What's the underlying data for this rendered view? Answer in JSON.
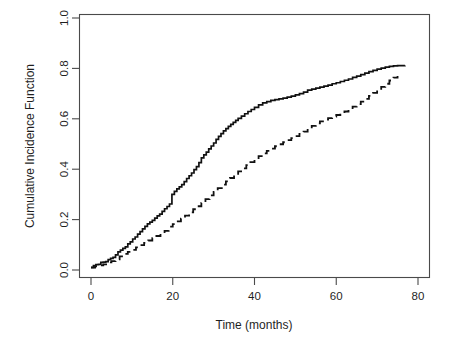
{
  "chart_data": {
    "type": "line",
    "title": "",
    "xlabel": "Time (months)",
    "ylabel": "Cumulative Incidence Function",
    "xlim": [
      -2.9,
      82.5
    ],
    "ylim": [
      -0.048,
      1.032
    ],
    "xticks": [
      0,
      20,
      40,
      60,
      80
    ],
    "xticklabels": [
      "0",
      "20",
      "40",
      "60",
      "80"
    ],
    "yticks": [
      0.0,
      0.2,
      0.4,
      0.6,
      0.8,
      1.0
    ],
    "yticklabels": [
      "0.0",
      "0.2",
      "0.4",
      "0.6",
      "0.8",
      "1.0"
    ],
    "grid": false,
    "legend": null,
    "box": true,
    "series": [
      {
        "name": "solid-curve",
        "style": "solid",
        "color": "#111111",
        "linewidth": 1.7,
        "points": [
          [
            0.0,
            0.01
          ],
          [
            0.6,
            0.017
          ],
          [
            1.2,
            0.021
          ],
          [
            1.8,
            0.022
          ],
          [
            2.4,
            0.03
          ],
          [
            3.0,
            0.031
          ],
          [
            3.6,
            0.033
          ],
          [
            4.2,
            0.041
          ],
          [
            4.8,
            0.046
          ],
          [
            5.4,
            0.05
          ],
          [
            6.0,
            0.06
          ],
          [
            6.6,
            0.072
          ],
          [
            7.2,
            0.079
          ],
          [
            7.8,
            0.086
          ],
          [
            8.4,
            0.092
          ],
          [
            9.0,
            0.104
          ],
          [
            9.6,
            0.112
          ],
          [
            10.2,
            0.123
          ],
          [
            10.8,
            0.131
          ],
          [
            11.4,
            0.142
          ],
          [
            12.0,
            0.152
          ],
          [
            12.6,
            0.163
          ],
          [
            13.2,
            0.173
          ],
          [
            13.8,
            0.183
          ],
          [
            14.4,
            0.19
          ],
          [
            15.0,
            0.197
          ],
          [
            15.6,
            0.206
          ],
          [
            16.2,
            0.215
          ],
          [
            16.8,
            0.222
          ],
          [
            17.4,
            0.233
          ],
          [
            18.0,
            0.243
          ],
          [
            18.6,
            0.252
          ],
          [
            19.2,
            0.262
          ],
          [
            19.8,
            0.3
          ],
          [
            20.4,
            0.312
          ],
          [
            21.0,
            0.322
          ],
          [
            21.6,
            0.33
          ],
          [
            22.2,
            0.339
          ],
          [
            22.8,
            0.351
          ],
          [
            23.4,
            0.363
          ],
          [
            24.0,
            0.374
          ],
          [
            24.6,
            0.385
          ],
          [
            25.2,
            0.398
          ],
          [
            25.8,
            0.41
          ],
          [
            26.4,
            0.426
          ],
          [
            27.0,
            0.445
          ],
          [
            27.6,
            0.457
          ],
          [
            28.2,
            0.468
          ],
          [
            28.8,
            0.481
          ],
          [
            29.4,
            0.492
          ],
          [
            30.0,
            0.504
          ],
          [
            30.6,
            0.518
          ],
          [
            31.2,
            0.53
          ],
          [
            31.8,
            0.541
          ],
          [
            32.4,
            0.552
          ],
          [
            33.0,
            0.561
          ],
          [
            33.6,
            0.57
          ],
          [
            34.2,
            0.578
          ],
          [
            34.8,
            0.586
          ],
          [
            35.4,
            0.594
          ],
          [
            36.0,
            0.602
          ],
          [
            36.8,
            0.611
          ],
          [
            37.6,
            0.62
          ],
          [
            38.4,
            0.629
          ],
          [
            39.2,
            0.637
          ],
          [
            40.0,
            0.645
          ],
          [
            41.0,
            0.655
          ],
          [
            42.0,
            0.663
          ],
          [
            43.0,
            0.668
          ],
          [
            44.0,
            0.673
          ],
          [
            45.0,
            0.676
          ],
          [
            46.0,
            0.679
          ],
          [
            47.0,
            0.682
          ],
          [
            48.0,
            0.686
          ],
          [
            49.0,
            0.69
          ],
          [
            50.0,
            0.695
          ],
          [
            51.0,
            0.7
          ],
          [
            52.0,
            0.706
          ],
          [
            53.0,
            0.714
          ],
          [
            54.0,
            0.718
          ],
          [
            55.0,
            0.722
          ],
          [
            56.0,
            0.726
          ],
          [
            57.0,
            0.73
          ],
          [
            58.0,
            0.734
          ],
          [
            59.0,
            0.739
          ],
          [
            60.0,
            0.743
          ],
          [
            61.0,
            0.748
          ],
          [
            62.0,
            0.753
          ],
          [
            63.0,
            0.758
          ],
          [
            64.0,
            0.764
          ],
          [
            65.0,
            0.769
          ],
          [
            66.0,
            0.775
          ],
          [
            67.0,
            0.781
          ],
          [
            68.0,
            0.787
          ],
          [
            69.0,
            0.792
          ],
          [
            70.0,
            0.797
          ],
          [
            71.0,
            0.801
          ],
          [
            72.0,
            0.805
          ],
          [
            73.0,
            0.808
          ],
          [
            74.0,
            0.81
          ],
          [
            75.0,
            0.811
          ],
          [
            76.8,
            0.812
          ]
        ]
      },
      {
        "name": "dashed-curve",
        "style": "dashed",
        "color": "#111111",
        "linewidth": 1.8,
        "dasharray": "7,5",
        "points": [
          [
            0.0,
            0.01
          ],
          [
            1.0,
            0.014
          ],
          [
            2.0,
            0.018
          ],
          [
            3.0,
            0.022
          ],
          [
            4.0,
            0.03
          ],
          [
            5.0,
            0.035
          ],
          [
            6.0,
            0.042
          ],
          [
            7.0,
            0.054
          ],
          [
            8.0,
            0.064
          ],
          [
            9.0,
            0.072
          ],
          [
            10.0,
            0.08
          ],
          [
            11.0,
            0.09
          ],
          [
            12.0,
            0.099
          ],
          [
            13.0,
            0.108
          ],
          [
            14.0,
            0.117
          ],
          [
            15.0,
            0.126
          ],
          [
            16.0,
            0.135
          ],
          [
            17.0,
            0.145
          ],
          [
            18.0,
            0.155
          ],
          [
            19.0,
            0.172
          ],
          [
            20.0,
            0.182
          ],
          [
            21.0,
            0.193
          ],
          [
            22.0,
            0.204
          ],
          [
            23.0,
            0.216
          ],
          [
            24.0,
            0.229
          ],
          [
            25.0,
            0.241
          ],
          [
            26.0,
            0.253
          ],
          [
            27.0,
            0.266
          ],
          [
            28.0,
            0.281
          ],
          [
            29.0,
            0.296
          ],
          [
            30.0,
            0.31
          ],
          [
            31.0,
            0.325
          ],
          [
            32.0,
            0.339
          ],
          [
            33.0,
            0.352
          ],
          [
            34.0,
            0.365
          ],
          [
            35.0,
            0.378
          ],
          [
            36.0,
            0.391
          ],
          [
            37.0,
            0.403
          ],
          [
            38.0,
            0.416
          ],
          [
            39.0,
            0.428
          ],
          [
            40.0,
            0.44
          ],
          [
            41.0,
            0.452
          ],
          [
            42.0,
            0.463
          ],
          [
            43.0,
            0.473
          ],
          [
            44.0,
            0.482
          ],
          [
            45.0,
            0.491
          ],
          [
            46.0,
            0.499
          ],
          [
            47.0,
            0.507
          ],
          [
            48.0,
            0.515
          ],
          [
            49.0,
            0.523
          ],
          [
            50.0,
            0.531
          ],
          [
            51.0,
            0.54
          ],
          [
            52.0,
            0.549
          ],
          [
            53.0,
            0.56
          ],
          [
            54.0,
            0.572
          ],
          [
            55.0,
            0.582
          ],
          [
            56.0,
            0.59
          ],
          [
            57.0,
            0.597
          ],
          [
            58.0,
            0.603
          ],
          [
            59.0,
            0.609
          ],
          [
            60.0,
            0.615
          ],
          [
            61.0,
            0.622
          ],
          [
            62.0,
            0.629
          ],
          [
            63.0,
            0.638
          ],
          [
            64.0,
            0.648
          ],
          [
            65.0,
            0.658
          ],
          [
            66.0,
            0.668
          ],
          [
            67.0,
            0.679
          ],
          [
            68.0,
            0.691
          ],
          [
            69.0,
            0.703
          ],
          [
            70.0,
            0.715
          ],
          [
            71.0,
            0.727
          ],
          [
            72.0,
            0.739
          ],
          [
            73.0,
            0.752
          ],
          [
            74.0,
            0.763
          ],
          [
            75.0,
            0.77
          ]
        ]
      }
    ]
  }
}
